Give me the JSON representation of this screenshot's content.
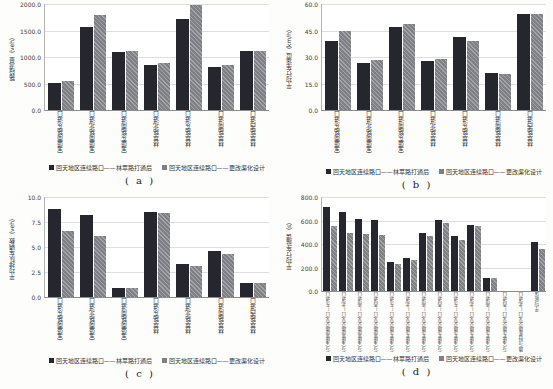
{
  "figure": {
    "series_colors": [
      "#26262e",
      "#7f7f86"
    ],
    "gridline_color": "#dedede",
    "background": "#fdfdfc"
  },
  "chart_data": [
    {
      "type": "bar",
      "caption": "( a )",
      "ylabel": "路段流量（veh）",
      "ylim": [
        0,
        2000
      ],
      "yticks": [
        0,
        500,
        1000,
        1500,
        2000
      ],
      "ytick_labels": [
        "0.0",
        "500.0",
        "1000.0",
        "1500.0",
        "2000.0"
      ],
      "grid": true,
      "legend_position": "bottom",
      "categories": [
        "宝盛南路东进口",
        "宝盛南路北进口",
        "宝盛东路南进口",
        "林萃路北进口",
        "林萃路东进口",
        "林萃路南进口",
        "林萃路西进口"
      ],
      "series": [
        {
          "name": "回天地区连续路口——林萃路打通后",
          "values": [
            510,
            1560,
            1100,
            850,
            1715,
            810,
            1110
          ]
        },
        {
          "name": "回天地区连续路口——更改渠化设计",
          "values": [
            550,
            1800,
            1115,
            880,
            1980,
            840,
            1120
          ]
        }
      ]
    },
    {
      "type": "bar",
      "caption": "( b )",
      "ylabel": "平均行车速度（km/h）",
      "ylim": [
        0,
        60
      ],
      "yticks": [
        0,
        15,
        30,
        45,
        60
      ],
      "ytick_labels": [
        "0.0",
        "15.0",
        "30.0",
        "45.0",
        "60.0"
      ],
      "grid": true,
      "legend_position": "bottom",
      "categories": [
        "宝盛南路东进口",
        "宝盛南路北进口",
        "宝盛东路南进口",
        "林萃路北进口",
        "林萃路东进口",
        "林萃路南进口",
        "林萃路西进口"
      ],
      "series": [
        {
          "name": "回天地区连续路口——林萃路打通后",
          "values": [
            39,
            26.5,
            47,
            28,
            41.5,
            21,
            54.5
          ]
        },
        {
          "name": "回天地区连续路口——更改渠化设计",
          "values": [
            45,
            28.5,
            48.5,
            29,
            39,
            20.5,
            54.5
          ]
        }
      ]
    },
    {
      "type": "bar",
      "caption": "( c )",
      "ylabel": "平均排队车辆数（veh）",
      "ylim": [
        0,
        10
      ],
      "yticks": [
        0,
        2.5,
        5,
        7.5,
        10
      ],
      "ytick_labels": [
        "0.0",
        "2.5",
        "5.0",
        "7.5",
        "10.0"
      ],
      "grid": true,
      "legend_position": "bottom",
      "categories": [
        "宝盛南路东进口",
        "宝盛南路北进口",
        "宝盛南路南进口",
        "林萃路东进口",
        "林萃路北进口",
        "林萃路南进口",
        "林萃路西进口"
      ],
      "series": [
        {
          "name": "回天地区连续路口——林萃路打通后",
          "values": [
            8.8,
            8.2,
            0.9,
            8.5,
            3.3,
            4.6,
            1.4
          ]
        },
        {
          "name": "回天地区连续路口——更改渠化设计",
          "values": [
            6.6,
            6.1,
            0.9,
            8.4,
            3.1,
            4.3,
            1.4
          ]
        }
      ]
    },
    {
      "type": "bar",
      "caption": "( d )",
      "ylabel": "平均行车延误（s）",
      "ylim": [
        0,
        800
      ],
      "yticks": [
        0,
        200,
        400,
        600,
        800
      ],
      "ytick_labels": [
        "0.0",
        "200.0",
        "400.0",
        "600.0",
        "800.0"
      ],
      "grid": true,
      "legend_position": "bottom",
      "categories": [
        "林萃路与宝盛南路交叉口—东进口",
        "林萃路与宝盛南路交叉口—北进口",
        "林萃路与宝盛南路交叉口—南进口",
        "林萃路与宝盛南路交叉口—西进口",
        "林萃路与宝盛东路交叉口—东进口",
        "林萃路与宝盛东路交叉口—北进口",
        "林萃路与宝盛东路交叉口—南进口",
        "林萃路与宝盛东路交叉口—西进口",
        "宝盛南路与宝盛东路交叉口—东进口",
        "宝盛南路与宝盛东路交叉口—北进口",
        "宝盛南路与宝盛东路交叉口—南进口",
        "宝盛南路与宝盛东路交叉口—西进口",
        "林萃路与科星路交叉口—北进口",
        "平均延误"
      ],
      "series": [
        {
          "name": "回天地区连续路口——林萃路打通后",
          "values": [
            715,
            670,
            615,
            605,
            250,
            285,
            495,
            605,
            465,
            565,
            115,
            0,
            0,
            415
          ]
        },
        {
          "name": "回天地区连续路口——更改渠化设计",
          "values": [
            550,
            495,
            485,
            475,
            230,
            260,
            465,
            580,
            435,
            555,
            115,
            0,
            0,
            360
          ]
        }
      ]
    }
  ]
}
